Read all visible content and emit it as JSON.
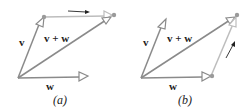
{
  "panels": [
    {
      "caption": "(a)",
      "labels": {
        "v": "v",
        "sum": "v + w",
        "w": "w"
      }
    },
    {
      "caption": "(b)",
      "labels": {
        "v": "v",
        "sum": "v + w",
        "w": "w"
      }
    }
  ],
  "colors": {
    "vector": "#8a8a8a",
    "translated_vector": "#bdbdbd",
    "dot": "#9a9a9a",
    "motion_arrow": "#222222",
    "text": "#222222"
  }
}
